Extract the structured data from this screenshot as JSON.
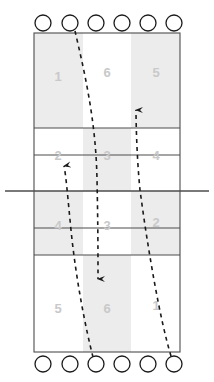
{
  "diagram": {
    "type": "volleyball-court-rotation",
    "colors": {
      "court_line": "#4d4d4d",
      "net_line": "#4d4d4d",
      "player_circle_stroke": "#1a1a1a",
      "shade_fill": "#ececec",
      "zone_label": "#c9c9c9",
      "arrow": "#1a1a1a",
      "background": "#ffffff"
    },
    "court": {
      "left": 34,
      "right": 180,
      "top": 33,
      "bottom": 352,
      "net_y": 191,
      "net_left": 5,
      "net_right": 209,
      "attack_line_top_y": 128,
      "attack_line_bottom_y": 255,
      "row_divider_top_y": 155,
      "row_divider_bottom_y": 228,
      "col_divider_left_x": 83,
      "col_divider_right_x": 131
    },
    "shaded_columns": {
      "top_half": [
        "left",
        "right"
      ],
      "bottom_half": [
        "left",
        "right"
      ],
      "center_band_note": "center column shaded in middle bands"
    },
    "top_half_zones": [
      {
        "zone": "1",
        "label": "1",
        "x": 58,
        "y": 78
      },
      {
        "zone": "6",
        "label": "6",
        "x": 107,
        "y": 74
      },
      {
        "zone": "5",
        "label": "5",
        "x": 156,
        "y": 74
      },
      {
        "zone": "2",
        "label": "2",
        "x": 58,
        "y": 157
      },
      {
        "zone": "3",
        "label": "3",
        "x": 107,
        "y": 157
      },
      {
        "zone": "4",
        "label": "4",
        "x": 156,
        "y": 157
      }
    ],
    "bottom_half_zones": [
      {
        "zone": "4",
        "label": "4",
        "x": 58,
        "y": 227
      },
      {
        "zone": "3",
        "label": "3",
        "x": 107,
        "y": 227
      },
      {
        "zone": "2",
        "label": "2",
        "x": 156,
        "y": 224
      },
      {
        "zone": "5",
        "label": "5",
        "x": 58,
        "y": 310
      },
      {
        "zone": "6",
        "label": "6",
        "x": 107,
        "y": 310
      },
      {
        "zone": "1",
        "label": "1",
        "x": 156,
        "y": 307
      }
    ],
    "top_players": [
      {
        "id": "tp1",
        "cx": 43,
        "cy": 23,
        "r": 8
      },
      {
        "id": "tp2",
        "cx": 70,
        "cy": 23,
        "r": 8
      },
      {
        "id": "tp3",
        "cx": 96,
        "cy": 23,
        "r": 8
      },
      {
        "id": "tp4",
        "cx": 122,
        "cy": 23,
        "r": 8
      },
      {
        "id": "tp5",
        "cx": 148,
        "cy": 23,
        "r": 8
      },
      {
        "id": "tp6",
        "cx": 174,
        "cy": 23,
        "r": 8
      }
    ],
    "bottom_players": [
      {
        "id": "bp1",
        "cx": 43,
        "cy": 364,
        "r": 8
      },
      {
        "id": "bp2",
        "cx": 70,
        "cy": 364,
        "r": 8
      },
      {
        "id": "bp3",
        "cx": 96,
        "cy": 364,
        "r": 8
      },
      {
        "id": "bp4",
        "cx": 122,
        "cy": 364,
        "r": 8
      },
      {
        "id": "bp5",
        "cx": 148,
        "cy": 364,
        "r": 8
      },
      {
        "id": "bp6",
        "cx": 174,
        "cy": 364,
        "r": 8
      }
    ],
    "movement_paths": [
      {
        "id": "path-down-center",
        "description": "from top player 2 curving down to zone 6 bottom-center",
        "d": "M 75,31 C 84,70 96,120 97,180 C 98,225 98,255 98,279",
        "arrow_at": "end",
        "arrow_dir": "down",
        "arrow_x": 98,
        "arrow_y": 286
      },
      {
        "id": "path-up-right",
        "description": "from bottom player 6 curving up through zones 1 and 2 to top-right",
        "d": "M 171,356 C 160,320 148,250 140,190 C 137,160 136,125 136,110",
        "arrow_at": "end",
        "arrow_dir": "up",
        "arrow_x": 136,
        "arrow_y": 101
      },
      {
        "id": "path-up-left",
        "description": "from bottom player 3 curving up through zones 5 and 4 to zone 2",
        "d": "M 93,357 C 86,330 76,280 71,230 C 68,200 66,175 64,166",
        "arrow_at": "end",
        "arrow_dir": "up-right",
        "arrow_x": 69,
        "arrow_y": 157
      }
    ]
  }
}
